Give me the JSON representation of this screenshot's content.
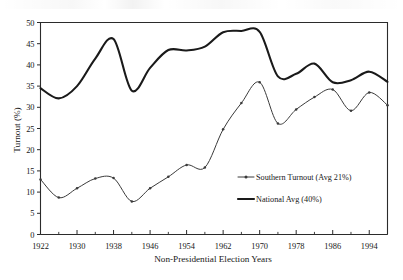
{
  "chart_data": {
    "type": "line",
    "title": "",
    "subtitle": "",
    "xlabel": "Non-Presidential Election Years",
    "ylabel": "Turnout (%)",
    "xlim": [
      1922,
      1998
    ],
    "ylim": [
      0,
      50
    ],
    "grid": false,
    "legend_position": "inside-right",
    "y_ticks": [
      0,
      5,
      10,
      15,
      20,
      25,
      30,
      35,
      40,
      45,
      50
    ],
    "y_tick_labels": [
      "0",
      "5",
      "10",
      "15",
      "20",
      "25",
      "30",
      "35",
      "40",
      "45",
      "50"
    ],
    "x_ticks": [
      1922,
      1930,
      1938,
      1946,
      1954,
      1962,
      1970,
      1978,
      1986,
      1994
    ],
    "x_tick_labels": [
      "1922",
      "1930",
      "1938",
      "1946",
      "1954",
      "1962",
      "1970",
      "1978",
      "1986",
      "1994"
    ],
    "x_minor_ticks": [
      1926,
      1934,
      1942,
      1950,
      1958,
      1966,
      1974,
      1982,
      1990,
      1998
    ],
    "x": [
      1922,
      1926,
      1930,
      1934,
      1938,
      1942,
      1946,
      1950,
      1954,
      1958,
      1962,
      1966,
      1970,
      1974,
      1978,
      1982,
      1986,
      1990,
      1994,
      1998
    ],
    "series": [
      {
        "name": "Southern Turnout (Avg 21%)",
        "color": "#3a3a3a",
        "linewidth": 1.0,
        "marker": "dot",
        "values": [
          13.0,
          8.7,
          10.9,
          13.2,
          13.3,
          7.8,
          10.9,
          13.6,
          16.4,
          15.8,
          24.8,
          31.0,
          35.9,
          26.2,
          29.5,
          32.4,
          34.2,
          29.2,
          33.5,
          30.5
        ]
      },
      {
        "name": "National Avg (40%)",
        "color": "#1a1a1a",
        "linewidth": 2.1,
        "marker": "none",
        "values": [
          34.5,
          32.1,
          35.0,
          41.5,
          46.1,
          33.9,
          39.3,
          43.5,
          43.4,
          44.3,
          47.7,
          48.0,
          47.8,
          37.3,
          37.9,
          40.3,
          35.9,
          36.4,
          38.4,
          36.0
        ]
      }
    ],
    "legend": [
      {
        "label": "Southern Turnout (Avg 21%)",
        "style": "line-with-marker"
      },
      {
        "label": "National Avg (40%)",
        "style": "thick-line"
      }
    ],
    "annotations": []
  }
}
